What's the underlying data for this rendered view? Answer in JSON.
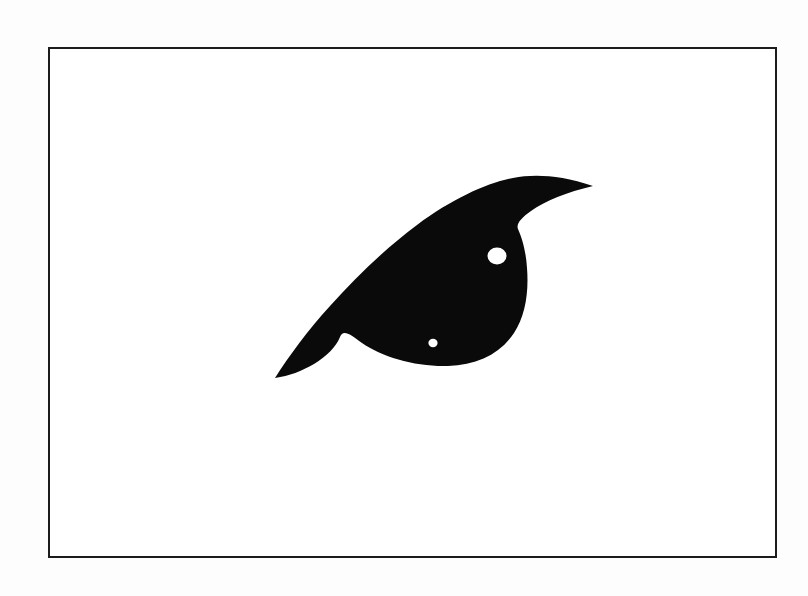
{
  "page": {
    "background_color": "#fdfdfd",
    "width": 808,
    "height": 596
  },
  "frame": {
    "name": "figure-border",
    "stroke_color": "#1c1c1c",
    "fill_color": "#ffffff",
    "stroke_width": 2.5,
    "left": 48,
    "top": 47,
    "width": 729,
    "height": 511
  },
  "figure": {
    "label": "",
    "fill_color": "#0a0a0a",
    "hole_color": "#ffffff",
    "bounds": {
      "x_min": 275,
      "y_min": 185,
      "x_max": 594,
      "y_max": 367
    },
    "key_points": {
      "left_tip": [
        275,
        378
      ],
      "right_spike_tip": [
        593,
        186
      ],
      "lower_notch_vertex": [
        340,
        337
      ],
      "upper_right_notch": [
        518,
        228
      ],
      "body_right_extreme": [
        527,
        281
      ],
      "body_bottom_extreme": [
        432,
        366
      ]
    },
    "holes": [
      {
        "name": "large-aperture",
        "cx": 497,
        "cy": 256,
        "rx": 9.5,
        "ry": 8.5
      },
      {
        "name": "small-aperture",
        "cx": 433,
        "cy": 343,
        "rx": 4.6,
        "ry": 4.2
      }
    ],
    "outline_path": "M 275 378 C 289 356 308 330 330 306 C 356 277 386 248 417 225 C 452 199 487 183 513 178 C 534 174 560 175 593 186 C 567 192 545 201 531 211 C 521 218 516 224 518 229 C 522 238 526 251 527 268 C 529 293 525 316 514 333 C 500 354 477 365 448 366 C 416 367 382 357 362 343 C 350 334 343 329 340 337 C 336 347 327 356 314 364 C 302 371 289 376 275 378 Z"
  },
  "colors": {
    "ink": "#0a0a0a",
    "paper": "#ffffff",
    "page_background": "#fdfdfd",
    "frame_stroke": "#1c1c1c"
  },
  "chart_data": {
    "type": "scatter",
    "title": "",
    "xlabel": "",
    "ylabel": "",
    "grid": false,
    "legend": "none",
    "xlim": [
      48,
      777
    ],
    "ylim": [
      47,
      558
    ],
    "annotations": [
      "solid black silhouette",
      "two white circular apertures"
    ],
    "series": [
      {
        "name": "apertures",
        "x": [
          497,
          433
        ],
        "y": [
          256,
          343
        ],
        "sizes": [
          9.5,
          4.6
        ]
      }
    ]
  }
}
